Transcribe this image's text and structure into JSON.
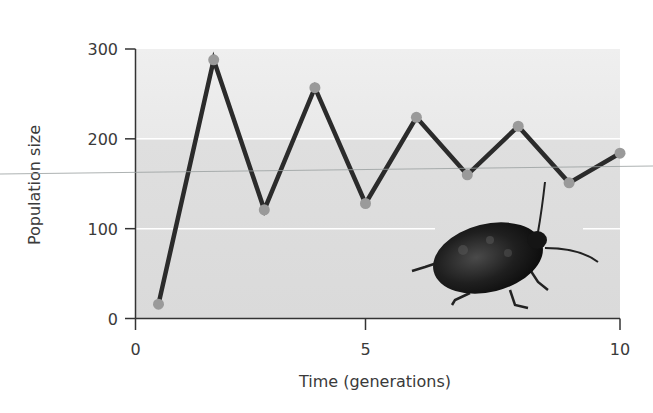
{
  "chart_data": {
    "type": "line",
    "title": "",
    "xlabel": "Time (generations)",
    "ylabel": "Population size",
    "xlim": [
      0,
      10
    ],
    "ylim": [
      0,
      300
    ],
    "x_ticks": [
      0,
      5,
      10
    ],
    "y_ticks": [
      0,
      100,
      200,
      300
    ],
    "x_tick_labels": [
      "0",
      "5",
      "10"
    ],
    "y_tick_labels": [
      "0",
      "100",
      "200",
      "300"
    ],
    "grid": "horizontal white lines at 100 and 200",
    "legend": null,
    "series": [
      {
        "name": "Population size",
        "color": "#2b2b2b",
        "marker_color": "#9a9a9a",
        "x": [
          0.5,
          1.7,
          2.8,
          3.9,
          5,
          6,
          7,
          8,
          9,
          10
        ],
        "values": [
          16,
          288,
          121,
          257,
          128,
          224,
          160,
          214,
          151,
          184
        ]
      }
    ],
    "annotations": [
      "photo of a dark beetle in lower right of plot area"
    ]
  },
  "colors": {
    "plot_bg_top": "#ececec",
    "plot_bg_bottom": "#dcdcdc",
    "line": "#2b2b2b",
    "marker": "#9a9a9a",
    "axis": "#333333",
    "grid": "#ffffff"
  }
}
